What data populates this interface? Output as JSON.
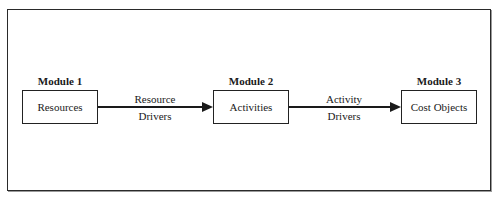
{
  "diagram": {
    "modules": [
      {
        "label": "Module 1",
        "box": "Resources"
      },
      {
        "label": "Module 2",
        "box": "Activities"
      },
      {
        "label": "Module 3",
        "box": "Cost Objects"
      }
    ],
    "connectors": [
      {
        "from": "Resources",
        "to": "Activities",
        "label_line1": "Resource",
        "label_line2": "Drivers"
      },
      {
        "from": "Activities",
        "to": "Cost Objects",
        "label_line1": "Activity",
        "label_line2": "Drivers"
      }
    ]
  }
}
